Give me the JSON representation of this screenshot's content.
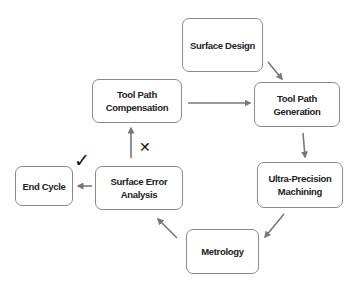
{
  "diagram": {
    "type": "cycle-flowchart",
    "nodes": [
      {
        "id": "surface_design",
        "label": "Surface Design",
        "x": 182,
        "y": 18,
        "w": 81,
        "h": 54
      },
      {
        "id": "tool_path_generation",
        "label": "Tool Path\nGeneration",
        "x": 254,
        "y": 82,
        "w": 86,
        "h": 45
      },
      {
        "id": "ultra_precision_machining",
        "label": "Ultra-Precision\nMachining",
        "x": 257,
        "y": 162,
        "w": 86,
        "h": 46
      },
      {
        "id": "metrology",
        "label": "Metrology",
        "x": 186,
        "y": 229,
        "w": 73,
        "h": 45
      },
      {
        "id": "surface_error_analysis",
        "label": "Surface Error\nAnalysis",
        "x": 95,
        "y": 166,
        "w": 88,
        "h": 44
      },
      {
        "id": "end_cycle",
        "label": "End Cycle",
        "x": 15,
        "y": 166,
        "w": 58,
        "h": 40
      },
      {
        "id": "tool_path_compensation",
        "label": "Tool  Path\nCompensation",
        "x": 92,
        "y": 79,
        "w": 90,
        "h": 44
      }
    ],
    "edges": [
      {
        "from": "surface_design",
        "to": "tool_path_generation"
      },
      {
        "from": "tool_path_generation",
        "to": "ultra_precision_machining"
      },
      {
        "from": "ultra_precision_machining",
        "to": "metrology"
      },
      {
        "from": "metrology",
        "to": "surface_error_analysis"
      },
      {
        "from": "surface_error_analysis",
        "to": "end_cycle",
        "condition": "pass"
      },
      {
        "from": "surface_error_analysis",
        "to": "tool_path_compensation",
        "condition": "fail"
      },
      {
        "from": "tool_path_compensation",
        "to": "tool_path_generation"
      }
    ],
    "marks": {
      "pass_symbol": "✓",
      "fail_symbol": "✕"
    },
    "colors": {
      "border": "#8a8a8a",
      "arrow": "#777777",
      "text": "#222222"
    }
  }
}
